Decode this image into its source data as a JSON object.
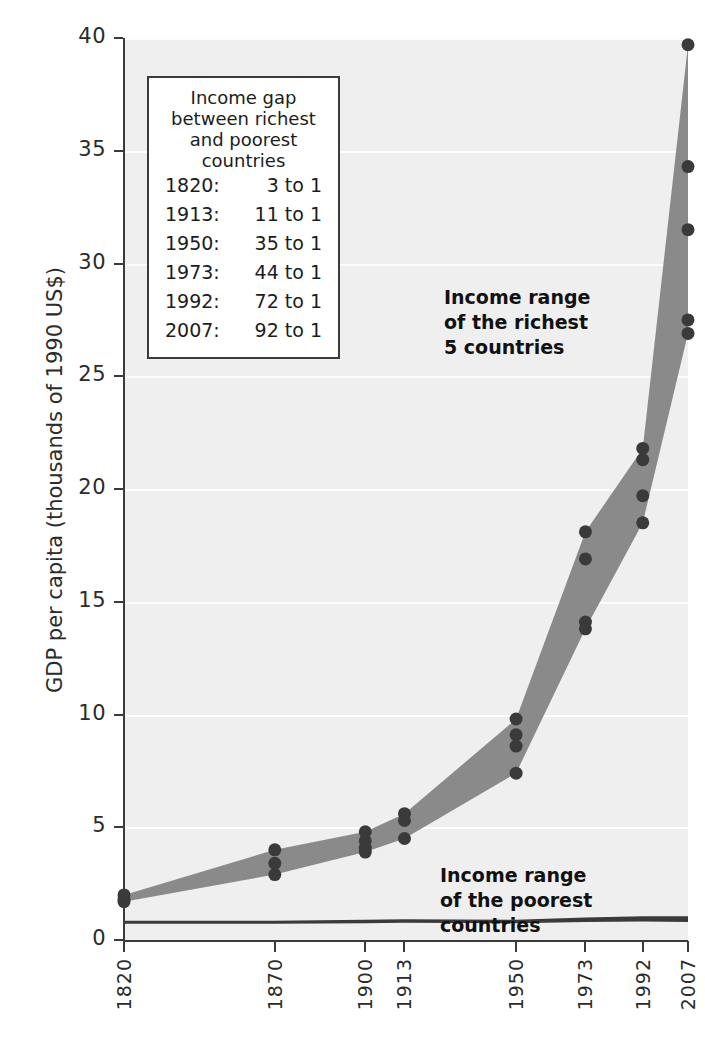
{
  "chart_data": {
    "type": "area",
    "title": "",
    "xlabel": "",
    "ylabel": "GDP per capita (thousands of 1990 US$)",
    "ylim": [
      0,
      40
    ],
    "yticks": [
      0,
      5,
      10,
      15,
      20,
      25,
      30,
      35,
      40
    ],
    "ytick_labels": [
      "0",
      "5",
      "10",
      "15",
      "20",
      "25",
      "30",
      "35",
      "40"
    ],
    "x": [
      1820,
      1870,
      1900,
      1913,
      1950,
      1973,
      1992,
      2007
    ],
    "xtick_labels": [
      "1820",
      "1870",
      "1900",
      "1913",
      "1950",
      "1973",
      "1992",
      "2007"
    ],
    "grid": true,
    "legend_position": "none",
    "series": [
      {
        "name": "Income range of the richest 5 countries",
        "type": "band",
        "upper": [
          2.0,
          4.0,
          4.8,
          5.6,
          9.8,
          18.1,
          21.8,
          39.7
        ],
        "lower": [
          1.7,
          2.9,
          3.9,
          4.5,
          7.4,
          13.8,
          18.5,
          26.9
        ]
      },
      {
        "name": "Income range of the poorest countries",
        "type": "band",
        "upper": [
          0.85,
          0.85,
          0.9,
          0.92,
          0.9,
          1.0,
          1.05,
          1.05
        ],
        "lower": [
          0.72,
          0.72,
          0.74,
          0.76,
          0.74,
          0.8,
          0.82,
          0.8
        ]
      }
    ],
    "points": {
      "1820": [
        2.0,
        1.8,
        1.7
      ],
      "1870": [
        4.0,
        3.4,
        2.9
      ],
      "1900": [
        4.8,
        4.4,
        4.1,
        3.9
      ],
      "1913": [
        5.6,
        5.3,
        4.5
      ],
      "1950": [
        9.8,
        9.1,
        8.6,
        7.4
      ],
      "1973": [
        18.1,
        16.9,
        14.1,
        13.8
      ],
      "1992": [
        21.8,
        21.3,
        19.7,
        18.5
      ],
      "2007": [
        39.7,
        34.3,
        31.5,
        27.5,
        26.9
      ]
    },
    "colors": {
      "band_rich": "#8a8a8a",
      "band_poor": "#3a3a3a",
      "point": "#3a3a3a",
      "plot_background": "#efefef",
      "axis": "#3b3b3b",
      "gridline": "#ffffff"
    }
  },
  "info_box": {
    "title": "Income gap\nbetween richest and\npoorest countries",
    "rows": [
      {
        "year": "1820:",
        "ratio": "3 to 1"
      },
      {
        "year": "1913:",
        "ratio": "11 to 1"
      },
      {
        "year": "1950:",
        "ratio": "35 to 1"
      },
      {
        "year": "1973:",
        "ratio": "44 to 1"
      },
      {
        "year": "1992:",
        "ratio": "72 to 1"
      },
      {
        "year": "2007:",
        "ratio": "92 to 1"
      }
    ]
  },
  "annotations": {
    "rich": "Income range\nof the richest\n5 countries",
    "poor": "Income range\nof the poorest\ncountries"
  }
}
